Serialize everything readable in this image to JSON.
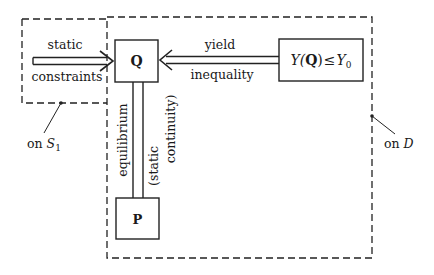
{
  "diagram": {
    "regions": {
      "boundary": {
        "label": "on S",
        "subscript": "1"
      },
      "domain": {
        "label": "on D"
      }
    },
    "nodes": {
      "q": {
        "label": "Q"
      },
      "p": {
        "label": "P"
      },
      "yield_condition": {
        "lhs": "Y(",
        "var": "Q",
        "rhs": ")",
        "rel": "≤",
        "bound": "Y",
        "bound_sub": "0"
      }
    },
    "edges": {
      "static_constraints": {
        "top_label": "static",
        "bottom_label": "constraints"
      },
      "yield_inequality": {
        "top_label": "yield",
        "bottom_label": "inequality"
      },
      "equilibrium": {
        "label": "equilibrium",
        "paren_label_1": "(static",
        "paren_label_2": "continuity)"
      }
    }
  }
}
